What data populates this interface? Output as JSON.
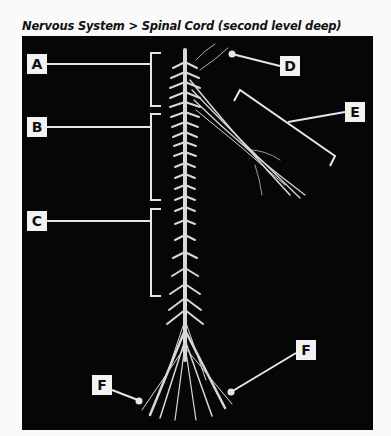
{
  "title": "Nervous System > Spinal Cord (second level deep)",
  "labels": {
    "a": "A",
    "b": "B",
    "c": "C",
    "d": "D",
    "e": "E",
    "f_left": "F",
    "f_right": "F"
  },
  "colors": {
    "background": "#060606",
    "label_box": "#f2f2f2",
    "leader_line": "#e6e6e6",
    "nerve": "#d8d8d8"
  }
}
